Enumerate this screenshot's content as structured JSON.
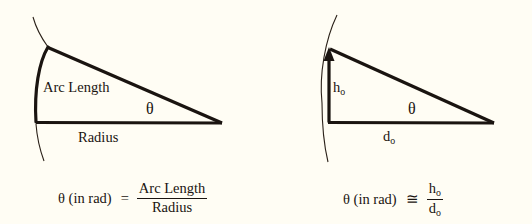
{
  "figure": {
    "background_color": "#fffdf4",
    "ink_color": "#1a1410",
    "width": 532,
    "height": 224
  },
  "left_panel": {
    "name": "arc-length-definition",
    "labels": {
      "arc_length": "Arc Length",
      "radius": "Radius",
      "theta": "θ"
    },
    "equation": {
      "lhs": "θ (in rad)",
      "operator": "=",
      "numerator": "Arc Length",
      "denominator": "Radius"
    },
    "geometry": {
      "vertex_apex": [
        222,
        123
      ],
      "vertex_center": [
        36,
        122
      ],
      "vertex_top": [
        48,
        47
      ],
      "arc_endpoint_top": [
        48,
        47
      ],
      "arc_endpoint_bottom": [
        36,
        122
      ]
    }
  },
  "right_panel": {
    "name": "small-angle-approximation",
    "labels": {
      "height": "h",
      "height_sub": "o",
      "distance": "d",
      "distance_sub": "o",
      "theta": "θ"
    },
    "equation": {
      "lhs": "θ (in rad)",
      "operator": "≅",
      "numerator": "h",
      "numerator_sub": "o",
      "denominator": "d",
      "denominator_sub": "o"
    },
    "geometry": {
      "vertex_apex": [
        494,
        123
      ],
      "vertex_center": [
        329,
        122
      ],
      "vertex_top": [
        329,
        52
      ],
      "arrow_head": "up"
    }
  }
}
